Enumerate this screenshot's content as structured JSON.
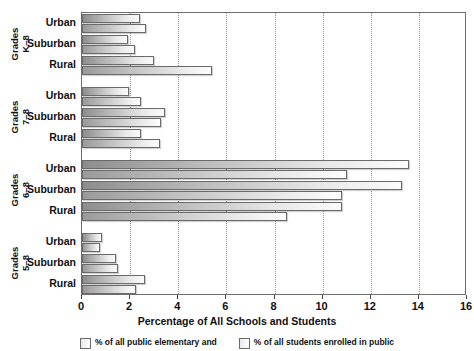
{
  "chart_data": {
    "type": "bar",
    "orientation": "horizontal",
    "title": "",
    "xlabel": "Percentage of All Schools and Students",
    "ylabel": "",
    "xlim": [
      0,
      16
    ],
    "xticks": [
      0,
      2,
      4,
      6,
      8,
      10,
      12,
      14,
      16
    ],
    "xtick_labels": [
      "0",
      "2",
      "4",
      "6",
      "8",
      "10",
      "12",
      "14",
      "16"
    ],
    "grid": true,
    "grid_axis": "x",
    "legend_position": "bottom",
    "groups": [
      {
        "name": "Grades K–8",
        "label_line1": "Grades",
        "label_line2": "K–8",
        "categories": [
          "Urban",
          "Suburban",
          "Rural"
        ]
      },
      {
        "name": "Grades 7–8",
        "label_line1": "Grades",
        "label_line2": "7–8",
        "categories": [
          "Urban",
          "Suburban",
          "Rural"
        ]
      },
      {
        "name": "Grades 6–8",
        "label_line1": "Grades",
        "label_line2": "6–8",
        "categories": [
          "Urban",
          "Suburban",
          "Rural"
        ]
      },
      {
        "name": "Grades 5–8",
        "label_line1": "Grades",
        "label_line2": "5–8",
        "categories": [
          "Urban",
          "Suburban",
          "Rural"
        ]
      }
    ],
    "series": [
      {
        "name": "% of all public elementary and",
        "key": "schools",
        "values": [
          2.4,
          1.9,
          3.0,
          1.95,
          3.45,
          2.45,
          13.6,
          13.3,
          10.8,
          0.85,
          1.4,
          2.6
        ]
      },
      {
        "name": "% of all students enrolled in public",
        "key": "students",
        "values": [
          2.65,
          2.2,
          5.4,
          2.45,
          3.3,
          3.25,
          11.0,
          10.8,
          8.5,
          0.73,
          1.5,
          2.25
        ]
      }
    ],
    "rows": [
      {
        "group": 0,
        "category": "Urban",
        "schools": 2.4,
        "students": 2.65
      },
      {
        "group": 0,
        "category": "Suburban",
        "schools": 1.9,
        "students": 2.2
      },
      {
        "group": 0,
        "category": "Rural",
        "schools": 3.0,
        "students": 5.4
      },
      {
        "group": 1,
        "category": "Urban",
        "schools": 1.95,
        "students": 2.45
      },
      {
        "group": 1,
        "category": "Suburban",
        "schools": 3.45,
        "students": 3.3
      },
      {
        "group": 1,
        "category": "Rural",
        "schools": 2.45,
        "students": 3.25
      },
      {
        "group": 2,
        "category": "Urban",
        "schools": 13.6,
        "students": 11.0
      },
      {
        "group": 2,
        "category": "Suburban",
        "schools": 13.3,
        "students": 10.8
      },
      {
        "group": 2,
        "category": "Rural",
        "schools": 10.8,
        "students": 8.5
      },
      {
        "group": 3,
        "category": "Urban",
        "schools": 0.85,
        "students": 0.73
      },
      {
        "group": 3,
        "category": "Suburban",
        "schools": 1.4,
        "students": 1.5
      },
      {
        "group": 3,
        "category": "Rural",
        "schools": 2.6,
        "students": 2.25
      }
    ]
  },
  "legend": {
    "items": [
      {
        "label": "% of all public elementary and",
        "swatch": "legend-swatch-schools"
      },
      {
        "label": "% of all students enrolled in public",
        "swatch": "legend-swatch-students"
      }
    ]
  },
  "colors": {
    "bar_gradient_start": "#8d8d8d",
    "bar_gradient_end": "#fbfbfb",
    "bar_border": "#6a6a6a",
    "gridline": "#9a9a9a",
    "axis": "#6e6e6e",
    "text": "#111111",
    "background": "#ffffff"
  }
}
